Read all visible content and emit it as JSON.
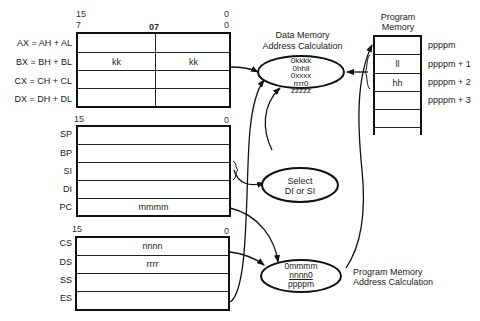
{
  "general_registers": {
    "bit_labels": {
      "high_left": "15",
      "high_right_top": "0",
      "low_left": "7",
      "mid": "07",
      "low_right": "0"
    },
    "rows": [
      {
        "label": "AX = AH + AL",
        "high": "",
        "low": ""
      },
      {
        "label": "BX = BH + BL",
        "high": "kk",
        "low": "kk"
      },
      {
        "label": "CX = CH + CL",
        "high": "",
        "low": ""
      },
      {
        "label": "DX = DH + DL",
        "high": "",
        "low": ""
      }
    ]
  },
  "pointer_registers": {
    "bit_labels": {
      "left": "15",
      "right": "0"
    },
    "rows": [
      {
        "label": "SP",
        "value": ""
      },
      {
        "label": "BP",
        "value": ""
      },
      {
        "label": "SI",
        "value": ""
      },
      {
        "label": "DI",
        "value": ""
      },
      {
        "label": "PC",
        "value": "mmmm"
      }
    ]
  },
  "segment_registers": {
    "bit_labels": {
      "left": "15",
      "right": "0"
    },
    "rows": [
      {
        "label": "CS",
        "value": "nnnn"
      },
      {
        "label": "DS",
        "value": "rrrr"
      },
      {
        "label": "SS",
        "value": ""
      },
      {
        "label": "ES",
        "value": ""
      }
    ]
  },
  "data_memory_calc": {
    "title_line1": "Data Memory",
    "title_line2": "Address Calculation",
    "lines": [
      "0kkkk",
      "0hhll",
      "0xxxx",
      "rrrr0",
      "zzzzz"
    ]
  },
  "select_node": {
    "line1": "Select",
    "line2": "DI or SI"
  },
  "program_memory_calc": {
    "title_line1": "Program Memory",
    "title_line2": "Address Calculation",
    "lines": [
      "0mmmm",
      "nnnn0",
      "ppppm"
    ]
  },
  "program_memory": {
    "title_line1": "Program",
    "title_line2": "Memory",
    "cells": [
      "",
      "ll",
      "hh",
      "",
      "",
      ""
    ],
    "addresses": [
      "ppppm",
      "ppppm + 1",
      "ppppm + 2",
      "ppppm + 3"
    ]
  }
}
